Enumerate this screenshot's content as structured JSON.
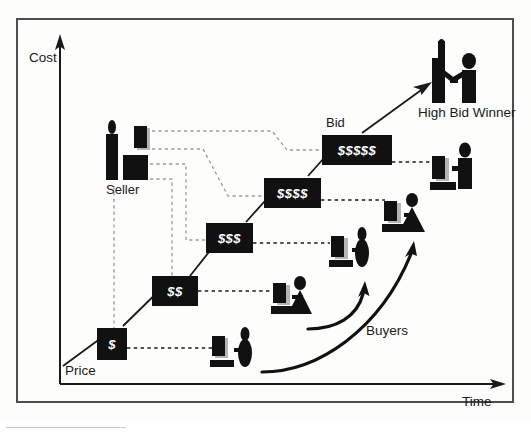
{
  "diagram": {
    "title_hidden": "",
    "axes": {
      "y_label": "Cost",
      "x_label": "Time",
      "origin_label": "Price"
    },
    "labels": {
      "seller": "Seller",
      "bid": "Bid",
      "winner": "High Bid Winner",
      "buyers": "Buyers"
    },
    "bid_steps": [
      {
        "label": "$",
        "x": 97,
        "y": 328,
        "w": 30,
        "h": 32
      },
      {
        "label": "$$",
        "x": 152,
        "y": 276,
        "w": 46,
        "h": 30
      },
      {
        "label": "$$$",
        "x": 206,
        "y": 223,
        "w": 47,
        "h": 30
      },
      {
        "label": "$$$$",
        "x": 264,
        "y": 178,
        "w": 57,
        "h": 30
      },
      {
        "label": "$$$$$",
        "x": 322,
        "y": 135,
        "w": 70,
        "h": 30
      }
    ],
    "colors": {
      "box_fill": "#111111",
      "box_text": "#ffffff",
      "ink": "#1a1a1a",
      "gray_dash": "#9b9b9b",
      "shadow": "#b5b5b5",
      "frame": "#4d4d4d",
      "page": "#fdfdfb"
    },
    "icon_names": {
      "seller": "seller-person-icon",
      "monitor": "monitor-icon",
      "keyboard": "keyboard-icon",
      "buyer_round": "buyer-round-person-icon",
      "buyer_triangle": "buyer-triangle-person-icon",
      "buyer_block": "buyer-block-person-icon",
      "handshake": "handshake-winner-icon",
      "y_axis_arrow": "y-axis-arrow-icon",
      "x_axis_arrow": "x-axis-arrow-icon",
      "trend_arrow": "rising-trend-arrow-icon",
      "buyers_arrow": "buyers-curved-arrow-icon"
    }
  }
}
